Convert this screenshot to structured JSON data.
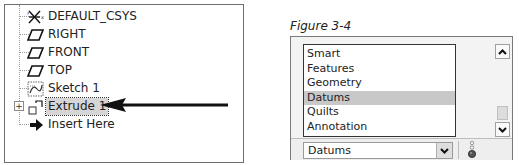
{
  "model_tree": {
    "items": [
      {
        "label": "DEFAULT_CSYS",
        "icon": "coordinate-system-icon"
      },
      {
        "label": "RIGHT",
        "icon": "datum-plane-icon"
      },
      {
        "label": "FRONT",
        "icon": "datum-plane-icon"
      },
      {
        "label": "TOP",
        "icon": "datum-plane-icon"
      },
      {
        "label": "Sketch 1",
        "icon": "sketch-icon"
      },
      {
        "label": "Extrude 1",
        "icon": "extrude-icon",
        "selected": true,
        "expandable": true,
        "expander": "+"
      },
      {
        "label": "Insert Here",
        "icon": "insert-arrow-icon"
      }
    ],
    "annotation": "pointer-arrow"
  },
  "figure": {
    "caption": "Figure 3-4"
  },
  "filter_panel": {
    "list_items": [
      {
        "label": "Smart"
      },
      {
        "label": "Features"
      },
      {
        "label": "Geometry"
      },
      {
        "label": "Datums",
        "selected": true
      },
      {
        "label": "Quilts"
      },
      {
        "label": "Annotation"
      }
    ],
    "dropdown": {
      "selected_value": "Datums"
    }
  },
  "colors": {
    "selection_bg": "#c8c8c8",
    "panel_bg": "#f3f3f3",
    "border": "#6e6e6e"
  }
}
